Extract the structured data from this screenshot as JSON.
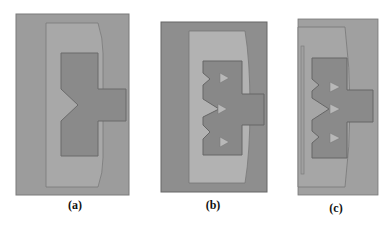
{
  "figure": {
    "panels": [
      {
        "id": "a",
        "caption": "(a)",
        "description": "Rectangular substrate with inner frame and T-shaped patch with a single triangular notch on the left edge"
      },
      {
        "id": "b",
        "caption": "(b)",
        "description": "Darker substrate, light frame, T-shaped patch with three notches on left edge and three triangular slots inside"
      },
      {
        "id": "c",
        "caption": "(c)",
        "description": "Cropped view: frame with left strip, T-shaped patch with three notches and three triangular slots"
      }
    ],
    "colors": {
      "substrate_a": "#9c9c9c",
      "frame_a": "#a8a8a8",
      "patch": "#8a8a8a",
      "substrate_b": "#8e8e8e",
      "frame_b": "#b2b2b2",
      "slot": "#b8b8b8",
      "outline": "#6a6a6a"
    }
  }
}
